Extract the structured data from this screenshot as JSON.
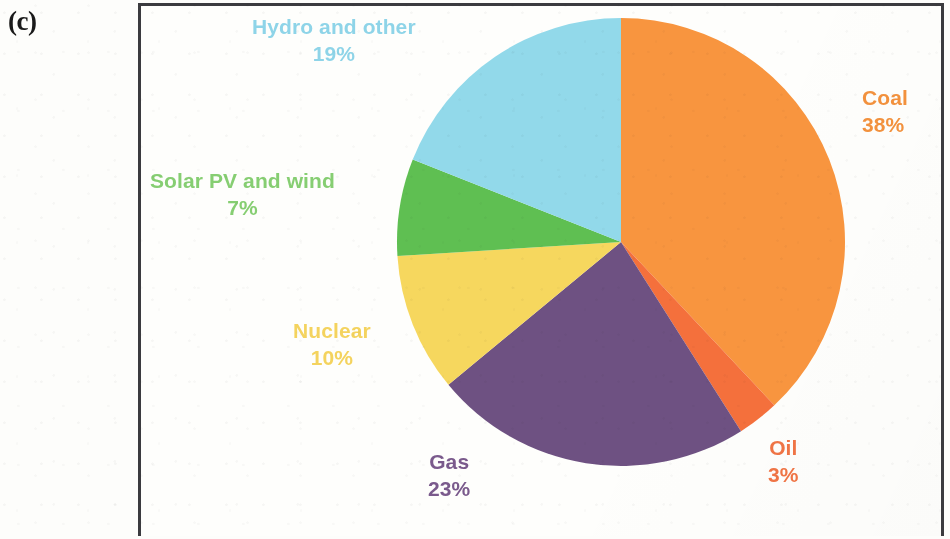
{
  "panel": {
    "label": "(c)"
  },
  "chart_data": {
    "type": "pie",
    "title": "",
    "subtitle": "",
    "xlabel": "",
    "ylabel": "",
    "legend_position": "callout-labels",
    "grid": false,
    "start_angle_deg": 0,
    "direction": "clockwise",
    "units": "percent",
    "total": 100,
    "categories": [
      "Coal",
      "Oil",
      "Gas",
      "Nuclear",
      "Solar PV and wind",
      "Hydro and other"
    ],
    "values": [
      38,
      3,
      23,
      10,
      7,
      19
    ],
    "colors": [
      "#F8953F",
      "#F4703C",
      "#6E5182",
      "#F6D75E",
      "#5FBF52",
      "#92D9EA"
    ],
    "slices": [
      {
        "name": "Coal",
        "value": 38,
        "label": "Coal",
        "pct": "38%",
        "color": "#F8953F",
        "label_color": "#F2913D"
      },
      {
        "name": "Oil",
        "value": 3,
        "label": "Oil",
        "pct": "3%",
        "color": "#F4703C",
        "label_color": "#EF7445"
      },
      {
        "name": "Gas",
        "value": 23,
        "label": "Gas",
        "pct": "23%",
        "color": "#6E5182",
        "label_color": "#7A5A8C"
      },
      {
        "name": "Nuclear",
        "value": 10,
        "label": "Nuclear",
        "pct": "10%",
        "color": "#F6D75E",
        "label_color": "#F4D35E"
      },
      {
        "name": "Solar PV and wind",
        "value": 7,
        "label": "Solar PV and wind",
        "pct": "7%",
        "color": "#5FBF52",
        "label_color": "#86CE72"
      },
      {
        "name": "Hydro and other",
        "value": 19,
        "label": "Hydro and other",
        "pct": "19%",
        "color": "#92D9EA",
        "label_color": "#8ED4E8"
      }
    ]
  },
  "geometry": {
    "center_x": 621,
    "center_y": 242,
    "radius": 224
  }
}
